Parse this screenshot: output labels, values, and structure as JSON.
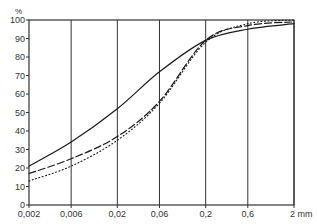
{
  "chart_data": {
    "type": "line",
    "title": "",
    "xlabel": "mm",
    "ylabel": "%",
    "x_scale": "log",
    "x": [
      0.002,
      0.006,
      0.02,
      0.06,
      0.2,
      0.6,
      2
    ],
    "x_tick_labels": [
      "0,002",
      "0,006",
      "0,02",
      "0,06",
      "0,2",
      "0,6",
      "2 mm"
    ],
    "y_ticks": [
      0,
      10,
      20,
      30,
      40,
      50,
      60,
      70,
      80,
      90,
      100
    ],
    "y_unit_label": "%",
    "ylim": [
      0,
      100
    ],
    "grid": {
      "vertical": true,
      "horizontal": false
    },
    "legend": null,
    "series": [
      {
        "name": "solid",
        "style": "solid",
        "values": [
          21,
          34,
          52,
          72,
          89,
          95,
          98
        ]
      },
      {
        "name": "dashed",
        "style": "dashed",
        "values": [
          17,
          25,
          37,
          56,
          89,
          97,
          99
        ]
      },
      {
        "name": "dotted",
        "style": "dotted",
        "values": [
          13,
          21,
          35,
          55,
          88,
          98,
          100
        ]
      }
    ]
  },
  "colors": {
    "line": "#1a1a1a",
    "grid": "#333333",
    "background": "#ffffff"
  }
}
